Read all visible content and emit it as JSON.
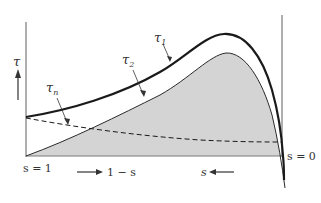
{
  "diagram": {
    "colors": {
      "axis": "#7a7a7a",
      "curve": "#1a1a1a",
      "shade": "#d4d4d4",
      "text": "#333333"
    },
    "labels": {
      "y_axis": "τ",
      "tau_1": "τ",
      "tau_1_sub": "1",
      "tau_2": "τ",
      "tau_2_sub": "2",
      "tau_n": "τ",
      "tau_n_sub": "n",
      "left_end": "s = 1",
      "right_end": "s = 0",
      "direction_right": "1 − s",
      "direction_left": "s"
    },
    "curves": [
      {
        "name": "tau_1",
        "style": "thick solid",
        "description": "upper curve, rises to peak near right end then drops"
      },
      {
        "name": "tau_2",
        "style": "thin solid",
        "description": "boundary of shaded region, starts at zero at s=1"
      },
      {
        "name": "tau_n",
        "style": "dashed",
        "description": "slowly decreasing from left to right"
      }
    ]
  }
}
